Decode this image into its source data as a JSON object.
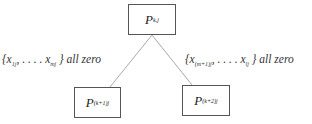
{
  "diagram": {
    "root": {
      "symbol": "P",
      "subscript": "k,j"
    },
    "children": [
      {
        "symbol": "P",
        "subscript": "(k+1)j"
      },
      {
        "symbol": "P",
        "subscript": "(k+2)j"
      }
    ],
    "edges": [
      {
        "from": "root",
        "to": "left-child",
        "label": {
          "open": "{x",
          "sub1": "1j",
          "dots": ", . . . . x",
          "sub2": "mj",
          "close": "}",
          "text": "all zero"
        }
      },
      {
        "from": "root",
        "to": "right-child",
        "label": {
          "open": "{x",
          "sub1": "(m+1)j",
          "dots": ", . . . . x",
          "sub2": "lj",
          "close": "}",
          "text": "all zero"
        }
      }
    ],
    "colors": {
      "line": "#999999",
      "border": "#555555",
      "text": "#333333"
    }
  }
}
